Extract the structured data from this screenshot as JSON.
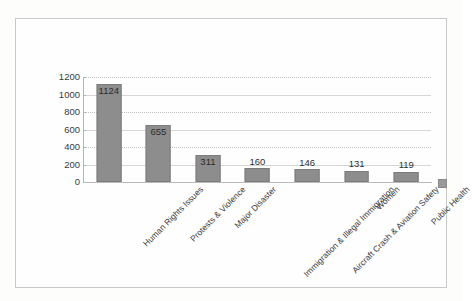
{
  "chart_data": {
    "type": "bar",
    "title": "",
    "xlabel": "",
    "ylabel": "",
    "categories": [
      "Human Rights Issues",
      "Protests & Violence",
      "Major Disaster",
      "Immigration & Illegal Immigration",
      "Aircraft Crash & Aviation Safety",
      "Women",
      "Public Health"
    ],
    "values": [
      1124,
      655,
      311,
      160,
      146,
      131,
      119
    ],
    "value_labels": [
      "1124",
      "655",
      "311",
      "160",
      "146",
      "131",
      "119"
    ],
    "ylim": [
      0,
      1200
    ],
    "yticks": [
      1200,
      1000,
      800,
      600,
      400,
      200,
      0
    ],
    "ytick_labels": [
      "1200",
      "1000",
      "800",
      "600",
      "400",
      "200",
      "0"
    ],
    "grid": true,
    "grid_axis": "y",
    "legend": "none",
    "bar_color": "#8d8d8d",
    "bar_edge_color": "#7c7c7c",
    "gridline_color": "#c0c0c0",
    "axis_color": "#b4b4b4",
    "text_color": "#3b3b3b",
    "background_color": "#fefefe",
    "frame_color": "#c9c9c9"
  },
  "legend_marker": {
    "name": "series-swatch",
    "color": "#9a9a9a"
  }
}
